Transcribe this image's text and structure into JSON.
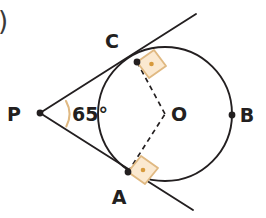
{
  "figure": {
    "corner_marker": ")",
    "background_color": "#ffffff",
    "stroke_color": "#231f20",
    "marker_fill": "#fbe9d0",
    "marker_stroke": "#e0b982",
    "marker_dot_color": "#d79a3c",
    "dash_color": "#231f20"
  },
  "labels": {
    "p": "P",
    "c": "C",
    "a": "A",
    "o": "O",
    "b": "B",
    "angle": "65°"
  },
  "geometry": {
    "circle": {
      "cx": 165,
      "cy": 114,
      "r": 67
    },
    "points": {
      "P": {
        "x": 40,
        "y": 113
      },
      "C": {
        "x": 137,
        "y": 62
      },
      "A": {
        "x": 128,
        "y": 172
      },
      "O": {
        "x": 165,
        "y": 114
      },
      "B": {
        "x": 232,
        "y": 115
      }
    },
    "tangent_upper": {
      "x1": 40,
      "y1": 113,
      "x2": 196,
      "y2": 14
    },
    "tangent_lower": {
      "x1": 40,
      "y1": 113,
      "x2": 193,
      "y2": 210
    },
    "angle_arc_radius": 26,
    "angle_value_degrees": 65
  },
  "label_positions": {
    "p": {
      "x": 14,
      "y": 121
    },
    "c": {
      "x": 110,
      "y": 48
    },
    "a": {
      "x": 117,
      "y": 203
    },
    "o": {
      "x": 170,
      "y": 121
    },
    "b": {
      "x": 241,
      "y": 122
    },
    "angle": {
      "x": 61,
      "y": 121
    },
    "corner_paren": {
      "x": -2,
      "y": 30
    }
  }
}
